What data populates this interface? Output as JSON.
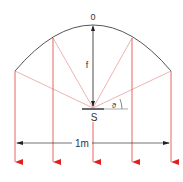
{
  "diagram": {
    "labels": {
      "vertex": "0",
      "focal_length": "f",
      "source": "S",
      "angle": "ϑ",
      "aperture": "1m"
    },
    "colors": {
      "curve": "#555555",
      "rays_incident": "#e8a0a0",
      "rays_reflected": "#e04040",
      "arrowhead": "#e02020",
      "dimension": "#333333",
      "text": "#333333"
    },
    "geometry": {
      "vertex": [
        93,
        25
      ],
      "source": [
        93,
        108
      ],
      "reflector_points": [
        [
          15,
          71
        ],
        [
          53,
          38
        ],
        [
          93,
          25
        ],
        [
          132,
          38
        ],
        [
          171,
          71
        ]
      ],
      "ray_bottom_y": 170,
      "dimension_y": 143
    }
  }
}
